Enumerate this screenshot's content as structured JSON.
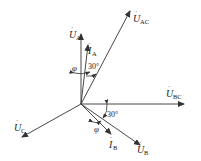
{
  "diagram": {
    "type": "phasor-diagram",
    "origin": [
      81,
      104
    ],
    "line_color": "#333333",
    "phasors": [
      {
        "id": "UA",
        "symbol": "U",
        "subscript": "A",
        "dot": true,
        "end": [
          81,
          34
        ]
      },
      {
        "id": "IA",
        "symbol": "I",
        "subscript": "A",
        "dot": true,
        "end": [
          88,
          45
        ]
      },
      {
        "id": "UAC",
        "symbol": "U",
        "subscript": "AC",
        "dot": true,
        "end": [
          130,
          11
        ]
      },
      {
        "id": "UBC",
        "symbol": "U",
        "subscript": "BC",
        "dot": true,
        "end": [
          184,
          104
        ]
      },
      {
        "id": "UC",
        "symbol": "U",
        "subscript": "C",
        "dot": true,
        "end": [
          22,
          137
        ]
      },
      {
        "id": "UB",
        "symbol": "U",
        "subscript": "B",
        "dot": true,
        "end": [
          140,
          145
        ]
      },
      {
        "id": "IB",
        "symbol": "I",
        "subscript": "B",
        "dot": true,
        "end": [
          111,
          134
        ]
      }
    ],
    "angle_labels": [
      {
        "id": "phi-A",
        "text": "φ"
      },
      {
        "id": "thirty-A",
        "text": "30°"
      },
      {
        "id": "thirty-B",
        "text": "30°"
      },
      {
        "id": "phi-B",
        "text": "φ"
      }
    ]
  }
}
